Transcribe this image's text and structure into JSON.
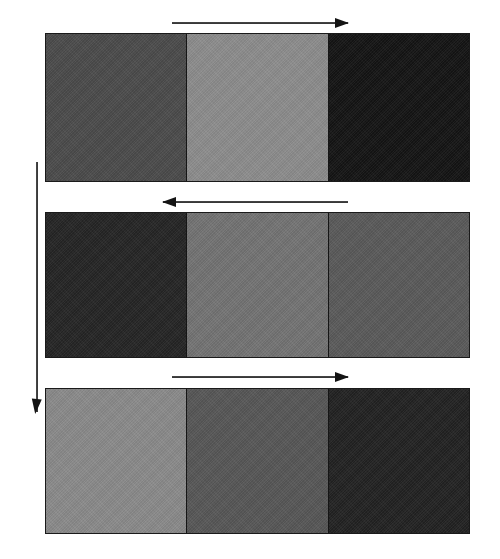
{
  "figure": {
    "background_color": "#ffffff",
    "border_color": "#1a1a1a",
    "width": 500,
    "height": 559
  },
  "vertical_arrow": {
    "name": "time-progression-arrow",
    "direction": "down",
    "label": "",
    "x": 37,
    "y_start": 162,
    "y_end": 412,
    "color": "#141414"
  },
  "rows": [
    {
      "index": 1,
      "name": "strip-row-1",
      "label": "",
      "arrow": {
        "name": "row-1-direction-arrow",
        "direction": "right",
        "label": "",
        "x_start": 172,
        "x_end": 348,
        "y": 22,
        "color": "#141414"
      },
      "panel": {
        "x": 45,
        "y": 33,
        "width": 425,
        "height": 149
      },
      "segments": [
        {
          "name": "row-1-segment-1",
          "label": "",
          "color": "#4c4c4c",
          "width_pct": 33.2
        },
        {
          "name": "row-1-segment-2",
          "label": "",
          "color": "#8d8d8d",
          "width_pct": 33.4
        },
        {
          "name": "row-1-segment-3",
          "label": "",
          "color": "#151515",
          "width_pct": 33.4
        }
      ]
    },
    {
      "index": 2,
      "name": "strip-row-2",
      "label": "",
      "arrow": {
        "name": "row-2-direction-arrow",
        "direction": "left",
        "label": "",
        "x_start": 163,
        "x_end": 348,
        "y": 201,
        "color": "#141414"
      },
      "panel": {
        "x": 45,
        "y": 212,
        "width": 425,
        "height": 146
      },
      "segments": [
        {
          "name": "row-2-segment-1",
          "label": "",
          "color": "#262626",
          "width_pct": 33.2
        },
        {
          "name": "row-2-segment-2",
          "label": "",
          "color": "#747474",
          "width_pct": 33.4
        },
        {
          "name": "row-2-segment-3",
          "label": "",
          "color": "#5b5b5b",
          "width_pct": 33.4
        }
      ]
    },
    {
      "index": 3,
      "name": "strip-row-3",
      "label": "",
      "arrow": {
        "name": "row-3-direction-arrow",
        "direction": "right",
        "label": "",
        "x_start": 172,
        "x_end": 348,
        "y": 376,
        "color": "#141414"
      },
      "panel": {
        "x": 45,
        "y": 388,
        "width": 425,
        "height": 146
      },
      "segments": [
        {
          "name": "row-3-segment-1",
          "label": "",
          "color": "#8b8b8b",
          "width_pct": 33.2
        },
        {
          "name": "row-3-segment-2",
          "label": "",
          "color": "#585858",
          "width_pct": 33.4
        },
        {
          "name": "row-3-segment-3",
          "label": "",
          "color": "#232323",
          "width_pct": 33.4
        }
      ]
    }
  ],
  "chart_data": {
    "type": "heatmap",
    "title": "",
    "xlabel": "",
    "ylabel": "",
    "legend_position": "none",
    "grid": false,
    "columns": [
      "segment-1",
      "segment-2",
      "segment-3"
    ],
    "rows": [
      "row-1",
      "row-2",
      "row-3"
    ],
    "values": [
      [
        76,
        141,
        21
      ],
      [
        38,
        116,
        91
      ],
      [
        139,
        88,
        35
      ]
    ],
    "value_units": "8-bit gray level (0=black, 255=white)",
    "annotations": [
      {
        "target": "row-1",
        "type": "arrow",
        "direction": "right"
      },
      {
        "target": "row-2",
        "type": "arrow",
        "direction": "left"
      },
      {
        "target": "row-3",
        "type": "arrow",
        "direction": "right"
      },
      {
        "target": "sequence",
        "type": "arrow",
        "direction": "down"
      }
    ]
  }
}
